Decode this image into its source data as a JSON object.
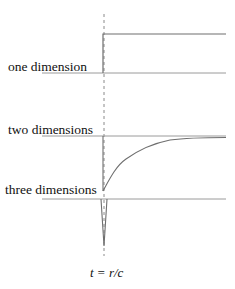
{
  "diagram": {
    "title": "",
    "labels": {
      "one_d": "one dimension",
      "two_d": "two dimensions",
      "three_d": "three dimensions",
      "time_marker": "t = r/c"
    },
    "colors": {
      "line": "#6e6e6e",
      "dashed": "#8a8a8a",
      "baseline": "#9a9a9a",
      "text": "#111111"
    },
    "panels": [
      {
        "name": "one dimension",
        "shape": "step",
        "baseline_y": 73,
        "top_y": 34,
        "onset_x": 103
      },
      {
        "name": "two dimensions",
        "shape": "jump-then-decay-toward-asymptote",
        "baseline_y": 136,
        "onset_x": 103,
        "start_y": 191
      },
      {
        "name": "three dimensions",
        "shape": "delta-spike",
        "baseline_y": 199,
        "tip_y": 245,
        "onset_x": 104
      }
    ]
  }
}
